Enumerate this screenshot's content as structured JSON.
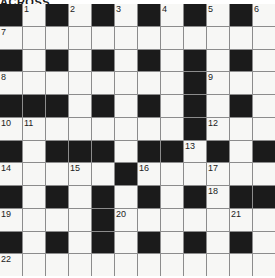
{
  "puzzle": {
    "masthead_text": "ACROSS",
    "rows": 12,
    "cols": 12,
    "colors": {
      "white_cell": "#f7f7f5",
      "black_cell": "#1b1b1b",
      "grid_line": "#8c8c8c",
      "number_text": "#222222",
      "page_background": "#ffffff"
    },
    "grid": [
      [
        "B",
        "W",
        "B",
        "W",
        "B",
        "W",
        "B",
        "W",
        "B",
        "W",
        "B",
        "W"
      ],
      [
        "W",
        "W",
        "W",
        "W",
        "W",
        "W",
        "W",
        "W",
        "W",
        "W",
        "W",
        "W"
      ],
      [
        "B",
        "W",
        "B",
        "W",
        "B",
        "W",
        "B",
        "W",
        "B",
        "W",
        "B",
        "W"
      ],
      [
        "W",
        "W",
        "W",
        "W",
        "W",
        "W",
        "W",
        "W",
        "B",
        "W",
        "W",
        "W"
      ],
      [
        "B",
        "B",
        "B",
        "W",
        "B",
        "W",
        "B",
        "W",
        "B",
        "W",
        "B",
        "W"
      ],
      [
        "W",
        "W",
        "W",
        "W",
        "W",
        "W",
        "W",
        "W",
        "B",
        "W",
        "W",
        "W"
      ],
      [
        "B",
        "W",
        "B",
        "B",
        "B",
        "W",
        "B",
        "B",
        "W",
        "B",
        "W",
        "B"
      ],
      [
        "W",
        "W",
        "W",
        "W",
        "W",
        "B",
        "W",
        "W",
        "W",
        "W",
        "W",
        "W"
      ],
      [
        "B",
        "W",
        "B",
        "W",
        "B",
        "W",
        "B",
        "W",
        "B",
        "W",
        "B",
        "B"
      ],
      [
        "W",
        "W",
        "W",
        "W",
        "B",
        "W",
        "W",
        "W",
        "W",
        "W",
        "W",
        "W"
      ],
      [
        "B",
        "W",
        "B",
        "W",
        "B",
        "W",
        "B",
        "W",
        "B",
        "W",
        "B",
        "W"
      ],
      [
        "W",
        "W",
        "W",
        "W",
        "W",
        "W",
        "W",
        "W",
        "W",
        "W",
        "W",
        "W"
      ]
    ],
    "numbers": [
      {
        "row": 0,
        "col": 1,
        "label": "1"
      },
      {
        "row": 0,
        "col": 3,
        "label": "2"
      },
      {
        "row": 0,
        "col": 5,
        "label": "3"
      },
      {
        "row": 0,
        "col": 7,
        "label": "4"
      },
      {
        "row": 0,
        "col": 9,
        "label": "5"
      },
      {
        "row": 0,
        "col": 11,
        "label": "6"
      },
      {
        "row": 1,
        "col": 0,
        "label": "7"
      },
      {
        "row": 3,
        "col": 0,
        "label": "8"
      },
      {
        "row": 3,
        "col": 9,
        "label": "9"
      },
      {
        "row": 5,
        "col": 0,
        "label": "10"
      },
      {
        "row": 5,
        "col": 1,
        "label": "11"
      },
      {
        "row": 5,
        "col": 9,
        "label": "12"
      },
      {
        "row": 6,
        "col": 8,
        "label": "13"
      },
      {
        "row": 7,
        "col": 0,
        "label": "14"
      },
      {
        "row": 7,
        "col": 3,
        "label": "15"
      },
      {
        "row": 7,
        "col": 6,
        "label": "16"
      },
      {
        "row": 7,
        "col": 9,
        "label": "17"
      },
      {
        "row": 8,
        "col": 9,
        "label": "18"
      },
      {
        "row": 9,
        "col": 0,
        "label": "19"
      },
      {
        "row": 9,
        "col": 5,
        "label": "20"
      },
      {
        "row": 9,
        "col": 10,
        "label": "21"
      },
      {
        "row": 11,
        "col": 0,
        "label": "22"
      }
    ]
  }
}
